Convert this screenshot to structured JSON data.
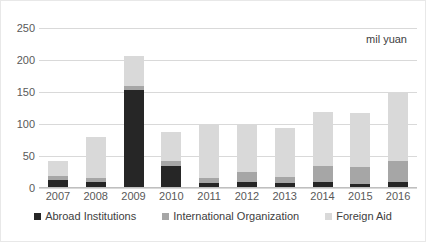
{
  "chart_data": {
    "type": "bar",
    "stacked": true,
    "title": "",
    "subtitle": "",
    "annotation": "mil yuan",
    "xlabel": "",
    "ylabel": "",
    "categories": [
      "2007",
      "2008",
      "2009",
      "2010",
      "2011",
      "2012",
      "2013",
      "2014",
      "2015",
      "2016"
    ],
    "series": [
      {
        "name": "Abroad Institutions",
        "color": "#262626",
        "values": [
          12,
          9,
          153,
          35,
          8,
          9,
          8,
          10,
          7,
          10
        ]
      },
      {
        "name": "International Organization",
        "color": "#a6a6a6",
        "values": [
          7,
          6,
          7,
          7,
          8,
          16,
          9,
          24,
          26,
          32
        ]
      },
      {
        "name": "Foreign Aid",
        "color": "#d9d9d9",
        "values": [
          23,
          64,
          47,
          45,
          83,
          74,
          77,
          85,
          85,
          106
        ]
      }
    ],
    "totals": [
      42,
      79,
      207,
      87,
      99,
      99,
      94,
      119,
      118,
      148
    ],
    "yticks": [
      0,
      50,
      100,
      150,
      200,
      250
    ],
    "ylim": [
      0,
      250
    ],
    "grid": true,
    "legend_position": "bottom"
  },
  "legend": {
    "items": [
      {
        "label": "Abroad Institutions",
        "color": "#262626"
      },
      {
        "label": "International Organization",
        "color": "#a6a6a6"
      },
      {
        "label": "Foreign Aid",
        "color": "#d9d9d9"
      }
    ]
  }
}
